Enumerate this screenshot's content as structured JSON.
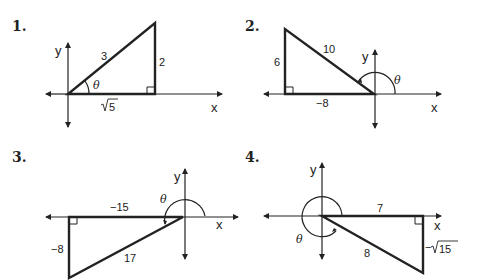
{
  "figures": [
    {
      "number": "1.",
      "hypotenuse": "3",
      "opposite": "2",
      "adjacent": "√5",
      "adjacent_radicand": "5",
      "angle": "θ",
      "x_axis": "x",
      "y_axis": "y",
      "quadrant": "I"
    },
    {
      "number": "2.",
      "hypotenuse": "10",
      "opposite": "6",
      "adjacent": "−8",
      "angle": "θ",
      "x_axis": "x",
      "y_axis": "y",
      "quadrant": "II"
    },
    {
      "number": "3.",
      "hypotenuse": "17",
      "opposite": "−8",
      "adjacent": "−15",
      "angle": "θ",
      "x_axis": "x",
      "y_axis": "y",
      "quadrant": "III"
    },
    {
      "number": "4.",
      "hypotenuse": "8",
      "opposite": "−√15",
      "opposite_sign": "−",
      "opposite_radicand": "15",
      "adjacent": "7",
      "angle": "θ",
      "x_axis": "x",
      "y_axis": "y",
      "quadrant": "IV"
    }
  ],
  "colors": {
    "line": "#222222",
    "background": "#ffffff"
  }
}
